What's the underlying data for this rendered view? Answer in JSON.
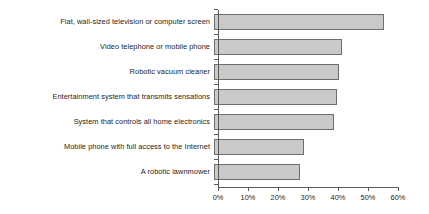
{
  "chart_data": {
    "type": "bar",
    "orientation": "horizontal",
    "title": "",
    "subtitle": "",
    "xlabel": "",
    "ylabel": "",
    "xlim": [
      0,
      60
    ],
    "xtick_step": 10,
    "xtick_labels": [
      "0%",
      "10%",
      "20%",
      "30%",
      "40%",
      "50%",
      "60%"
    ],
    "xtick_values": [
      0,
      10,
      20,
      30,
      40,
      50,
      60
    ],
    "grid": false,
    "legend": false,
    "legend_position": "none",
    "categories": [
      "Flat, wall-sized television or computer screen",
      "Video telephone or mobile phone",
      "Robotic vacuum cleaner",
      "Entertainment system that transmits sensations",
      "System that controls all home electronics",
      "Mobile phone with full access to the Internet",
      "A robotic lawnmower"
    ],
    "values": [
      56.5,
      42.5,
      41.5,
      41.0,
      40.0,
      30.0,
      28.5
    ],
    "value_unit": "%",
    "bar_fill_color": "#c9c9c9",
    "bar_border_color": "#6e6e6e",
    "axis_color": "#5a5a5a",
    "text_color": "#1d1d1d",
    "background_color": "#ffffff"
  }
}
